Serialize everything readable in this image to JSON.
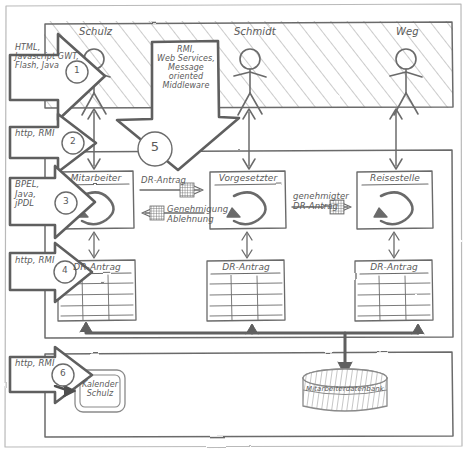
{
  "diagram": {
    "style": "hand-drawn sketch, grey pencil on white",
    "stroke_color": "#6b6b6b",
    "arrow_color": "#5f5f5f",
    "text_color": "#5a5a5a"
  },
  "layers": {
    "presentation": {
      "name": "presentation-layer",
      "hatched": true,
      "actors": [
        {
          "name": "Schulz"
        },
        {
          "name": "Schmidt"
        },
        {
          "name": "Weg"
        }
      ]
    },
    "process": {
      "name": "process-layer",
      "components": [
        {
          "label": "Mitarbeiter"
        },
        {
          "label": "Vorgesetzter"
        },
        {
          "label": "Reisestelle"
        }
      ],
      "entities": [
        {
          "label": "DR-Antrag"
        },
        {
          "label": "DR-Antrag"
        },
        {
          "label": "DR-Antrag"
        }
      ],
      "messages": [
        {
          "label": "DR-Antrag",
          "direction": "right"
        },
        {
          "label": "Genehmigung\nAblehnung",
          "direction": "left"
        },
        {
          "label": "genehmigter\nDR-Antrag",
          "direction": "right"
        }
      ]
    },
    "resource": {
      "name": "resource-layer",
      "calendar": "Kalender\nSchulz",
      "database": "Mitarbeiterdatenbank"
    }
  },
  "annotations": [
    {
      "id": "1",
      "text": "HTML,\nJavascript GWT,\nFlash, Java"
    },
    {
      "id": "2",
      "text": "http, RMI"
    },
    {
      "id": "3",
      "text": "BPEL,\nJava,\njPDL"
    },
    {
      "id": "4",
      "text": "http, RMI"
    },
    {
      "id": "5",
      "text": "RMI,\nWeb Services,\nMessage\noriented\nMiddleware"
    },
    {
      "id": "6",
      "text": "http, RMI"
    }
  ]
}
